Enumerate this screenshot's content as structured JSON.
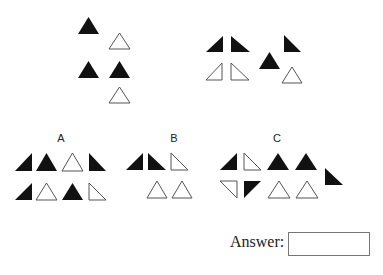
{
  "puzzle": {
    "question_groups": [
      {
        "name": "left-group",
        "shapes": [
          {
            "type": "iso",
            "fill": "filled",
            "x": 78,
            "y": 17,
            "w": 21,
            "h": 17
          },
          {
            "type": "iso",
            "fill": "outline",
            "x": 109,
            "y": 33,
            "w": 21,
            "h": 16
          },
          {
            "type": "iso",
            "fill": "filled",
            "x": 78,
            "y": 61,
            "w": 21,
            "h": 17
          },
          {
            "type": "iso",
            "fill": "filled",
            "x": 109,
            "y": 61,
            "w": 21,
            "h": 17
          },
          {
            "type": "iso",
            "fill": "outline",
            "x": 109,
            "y": 87,
            "w": 21,
            "h": 16
          }
        ]
      },
      {
        "name": "right-group",
        "shapes": [
          {
            "type": "right-br",
            "fill": "filled",
            "x": 206,
            "y": 36,
            "w": 17,
            "h": 16
          },
          {
            "type": "right-bl",
            "fill": "filled",
            "x": 231,
            "y": 36,
            "w": 19,
            "h": 16
          },
          {
            "type": "right-br",
            "fill": "outline",
            "x": 206,
            "y": 63,
            "w": 16,
            "h": 17
          },
          {
            "type": "right-bl",
            "fill": "outline",
            "x": 231,
            "y": 63,
            "w": 18,
            "h": 17
          },
          {
            "type": "iso",
            "fill": "filled",
            "x": 259,
            "y": 52,
            "w": 21,
            "h": 17
          },
          {
            "type": "right-bl",
            "fill": "filled",
            "x": 284,
            "y": 35,
            "w": 17,
            "h": 17
          },
          {
            "type": "iso",
            "fill": "outline",
            "x": 282,
            "y": 67,
            "w": 20,
            "h": 16
          }
        ]
      }
    ],
    "options": [
      {
        "label": "A",
        "label_x": 61,
        "label_y": 132,
        "shapes": [
          {
            "type": "right-br",
            "fill": "filled",
            "x": 15,
            "y": 153,
            "w": 17,
            "h": 18
          },
          {
            "type": "iso",
            "fill": "filled",
            "x": 36,
            "y": 153,
            "w": 21,
            "h": 18
          },
          {
            "type": "iso",
            "fill": "outline",
            "x": 62,
            "y": 153,
            "w": 21,
            "h": 18
          },
          {
            "type": "right-bl",
            "fill": "filled",
            "x": 89,
            "y": 153,
            "w": 17,
            "h": 18
          },
          {
            "type": "right-br",
            "fill": "filled",
            "x": 15,
            "y": 183,
            "w": 17,
            "h": 17
          },
          {
            "type": "iso",
            "fill": "outline",
            "x": 36,
            "y": 183,
            "w": 21,
            "h": 17
          },
          {
            "type": "iso",
            "fill": "filled",
            "x": 62,
            "y": 183,
            "w": 21,
            "h": 17
          },
          {
            "type": "right-bl",
            "fill": "outline",
            "x": 89,
            "y": 183,
            "w": 17,
            "h": 17
          }
        ]
      },
      {
        "label": "B",
        "label_x": 174,
        "label_y": 132,
        "shapes": [
          {
            "type": "right-br",
            "fill": "filled",
            "x": 126,
            "y": 153,
            "w": 17,
            "h": 17
          },
          {
            "type": "right-bl",
            "fill": "filled",
            "x": 148,
            "y": 153,
            "w": 18,
            "h": 17
          },
          {
            "type": "right-bl",
            "fill": "outline",
            "x": 171,
            "y": 153,
            "w": 17,
            "h": 17
          },
          {
            "type": "iso",
            "fill": "outline",
            "x": 147,
            "y": 181,
            "w": 20,
            "h": 17
          },
          {
            "type": "iso",
            "fill": "outline",
            "x": 172,
            "y": 181,
            "w": 20,
            "h": 17
          }
        ]
      },
      {
        "label": "C",
        "label_x": 277,
        "label_y": 132,
        "shapes": [
          {
            "type": "right-br",
            "fill": "filled",
            "x": 220,
            "y": 153,
            "w": 17,
            "h": 17
          },
          {
            "type": "right-bl",
            "fill": "outline",
            "x": 244,
            "y": 153,
            "w": 17,
            "h": 17
          },
          {
            "type": "iso",
            "fill": "filled",
            "x": 267,
            "y": 153,
            "w": 22,
            "h": 17
          },
          {
            "type": "iso",
            "fill": "filled",
            "x": 295,
            "y": 153,
            "w": 22,
            "h": 17
          },
          {
            "type": "right-bl",
            "fill": "filled",
            "x": 325,
            "y": 168,
            "w": 18,
            "h": 17
          },
          {
            "type": "right-tr",
            "fill": "outline",
            "x": 220,
            "y": 181,
            "w": 17,
            "h": 17
          },
          {
            "type": "right-tl",
            "fill": "filled",
            "x": 244,
            "y": 181,
            "w": 17,
            "h": 17
          },
          {
            "type": "iso",
            "fill": "outline",
            "x": 268,
            "y": 181,
            "w": 22,
            "h": 17
          },
          {
            "type": "iso",
            "fill": "outline",
            "x": 296,
            "y": 181,
            "w": 22,
            "h": 17
          }
        ]
      }
    ],
    "answer": {
      "label": "Answer:",
      "value": ""
    },
    "colors": {
      "filled": "#111111",
      "outline_stroke": "#555555",
      "outline_fill": "#ffffff"
    }
  }
}
